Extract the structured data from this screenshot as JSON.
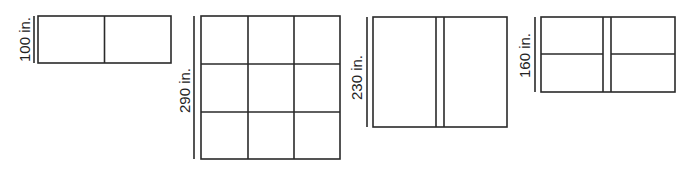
{
  "figures": [
    {
      "id": "fig-a",
      "label": "100 in.",
      "layout": "2 panels side by side (1 row × 2 cols)"
    },
    {
      "id": "fig-b",
      "label": "290 in.",
      "layout": "3 × 3 grid of panels"
    },
    {
      "id": "fig-c",
      "label": "230 in.",
      "layout": "2 tall panels separated by a double vertical divider"
    },
    {
      "id": "fig-d",
      "label": "160 in.",
      "layout": "2 × 2 panels with double vertical divider and single horizontal divider"
    }
  ],
  "colors": {
    "line": "#2a2a2a",
    "background": "#ffffff",
    "text": "#222222"
  }
}
